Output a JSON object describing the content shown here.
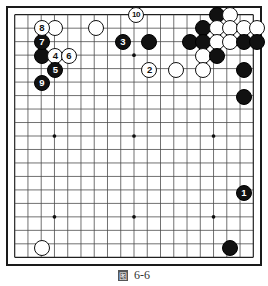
{
  "figure": {
    "type": "go-board-diagram",
    "board_size": 19,
    "caption_tag": "图",
    "caption_text": "6-6"
  },
  "board": {
    "lines": 19,
    "star_points": [
      [
        3,
        3
      ],
      [
        9,
        3
      ],
      [
        15,
        3
      ],
      [
        3,
        9
      ],
      [
        9,
        9
      ],
      [
        15,
        9
      ],
      [
        3,
        15
      ],
      [
        9,
        15
      ],
      [
        15,
        15
      ]
    ],
    "colors": {
      "grid": "#4a4a4a",
      "border": "#1a1a1a",
      "black_stone": "#111111",
      "white_stone": "#ffffff",
      "black_label": "#ffffff",
      "white_label": "#111111"
    }
  },
  "stones": [
    {
      "id": "w-a1",
      "color": "white",
      "col": 3,
      "row": 1,
      "label": ""
    },
    {
      "id": "b-a2",
      "color": "black",
      "col": 2,
      "row": 3,
      "label": ""
    },
    {
      "id": "w-mid-top",
      "color": "white",
      "col": 6,
      "row": 1,
      "label": ""
    },
    {
      "id": "b-top-1",
      "color": "black",
      "col": 10,
      "row": 2,
      "label": ""
    },
    {
      "id": "w-top-2",
      "color": "white",
      "col": 12,
      "row": 4,
      "label": ""
    },
    {
      "id": "b-tr-1",
      "color": "black",
      "col": 15,
      "row": 0,
      "label": ""
    },
    {
      "id": "w-tr-1",
      "color": "white",
      "col": 16,
      "row": 0,
      "label": ""
    },
    {
      "id": "b-tr-2",
      "color": "black",
      "col": 14,
      "row": 1,
      "label": ""
    },
    {
      "id": "w-tr-2",
      "color": "white",
      "col": 15,
      "row": 1,
      "label": ""
    },
    {
      "id": "w-tr-3",
      "color": "white",
      "col": 16,
      "row": 1,
      "label": ""
    },
    {
      "id": "w-tr-4",
      "color": "white",
      "col": 17,
      "row": 1,
      "label": ""
    },
    {
      "id": "w-tr-5",
      "color": "white",
      "col": 18,
      "row": 1,
      "label": ""
    },
    {
      "id": "b-tr-3",
      "color": "black",
      "col": 13,
      "row": 2,
      "label": ""
    },
    {
      "id": "b-tr-4",
      "color": "black",
      "col": 14,
      "row": 2,
      "label": ""
    },
    {
      "id": "w-tr-6",
      "color": "white",
      "col": 15,
      "row": 2,
      "label": ""
    },
    {
      "id": "w-tr-7",
      "color": "white",
      "col": 16,
      "row": 2,
      "label": ""
    },
    {
      "id": "b-tr-5",
      "color": "black",
      "col": 17,
      "row": 2,
      "label": ""
    },
    {
      "id": "b-tr-6",
      "color": "black",
      "col": 18,
      "row": 2,
      "label": ""
    },
    {
      "id": "w-tr-8",
      "color": "white",
      "col": 14,
      "row": 3,
      "label": ""
    },
    {
      "id": "b-tr-7",
      "color": "black",
      "col": 15,
      "row": 3,
      "label": ""
    },
    {
      "id": "w-tr-9",
      "color": "white",
      "col": 14,
      "row": 4,
      "label": ""
    },
    {
      "id": "b-tr-8",
      "color": "black",
      "col": 17,
      "row": 4,
      "label": ""
    },
    {
      "id": "b-tr-9",
      "color": "black",
      "col": 17,
      "row": 6,
      "label": ""
    },
    {
      "id": "b-right-1",
      "color": "black",
      "col": 17,
      "row": 13,
      "label": "1"
    },
    {
      "id": "b-bot-1",
      "color": "black",
      "col": 16,
      "row": 17,
      "label": ""
    },
    {
      "id": "w-bot-1",
      "color": "white",
      "col": 2,
      "row": 17,
      "label": ""
    },
    {
      "id": "w-move-2",
      "color": "white",
      "col": 10,
      "row": 4,
      "label": "2"
    },
    {
      "id": "b-move-3",
      "color": "black",
      "col": 8,
      "row": 2,
      "label": "3"
    },
    {
      "id": "w-move-4",
      "color": "white",
      "col": 3,
      "row": 3,
      "label": "4"
    },
    {
      "id": "b-move-5",
      "color": "black",
      "col": 3,
      "row": 4,
      "label": "5"
    },
    {
      "id": "w-move-6",
      "color": "white",
      "col": 4,
      "row": 3,
      "label": "6"
    },
    {
      "id": "b-move-7",
      "color": "black",
      "col": 2,
      "row": 2,
      "label": "7"
    },
    {
      "id": "w-move-8",
      "color": "white",
      "col": 2,
      "row": 1,
      "label": "8"
    },
    {
      "id": "b-move-9",
      "color": "black",
      "col": 2,
      "row": 5,
      "label": "9"
    },
    {
      "id": "w-move-10",
      "color": "white",
      "col": 9,
      "row": 0,
      "label": "10"
    }
  ]
}
